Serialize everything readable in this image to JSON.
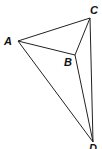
{
  "diagram": {
    "type": "geometric-figure",
    "vertices": [
      {
        "id": "A",
        "label": "A",
        "x": 18,
        "y": 41,
        "label_x": 4,
        "label_y": 45
      },
      {
        "id": "B",
        "label": "B",
        "x": 75,
        "y": 55,
        "label_x": 64,
        "label_y": 66
      },
      {
        "id": "C",
        "label": "C",
        "x": 90,
        "y": 18,
        "label_x": 90,
        "label_y": 14
      },
      {
        "id": "D",
        "label": "D",
        "x": 93,
        "y": 142,
        "label_x": 89,
        "label_y": 152
      }
    ],
    "edges": [
      {
        "from": "A",
        "to": "C"
      },
      {
        "from": "A",
        "to": "B"
      },
      {
        "from": "B",
        "to": "C"
      },
      {
        "from": "A",
        "to": "D"
      },
      {
        "from": "B",
        "to": "D"
      },
      {
        "from": "C",
        "to": "D"
      }
    ]
  },
  "labels": {
    "a": "A",
    "b": "B",
    "c": "C",
    "d": "D"
  }
}
